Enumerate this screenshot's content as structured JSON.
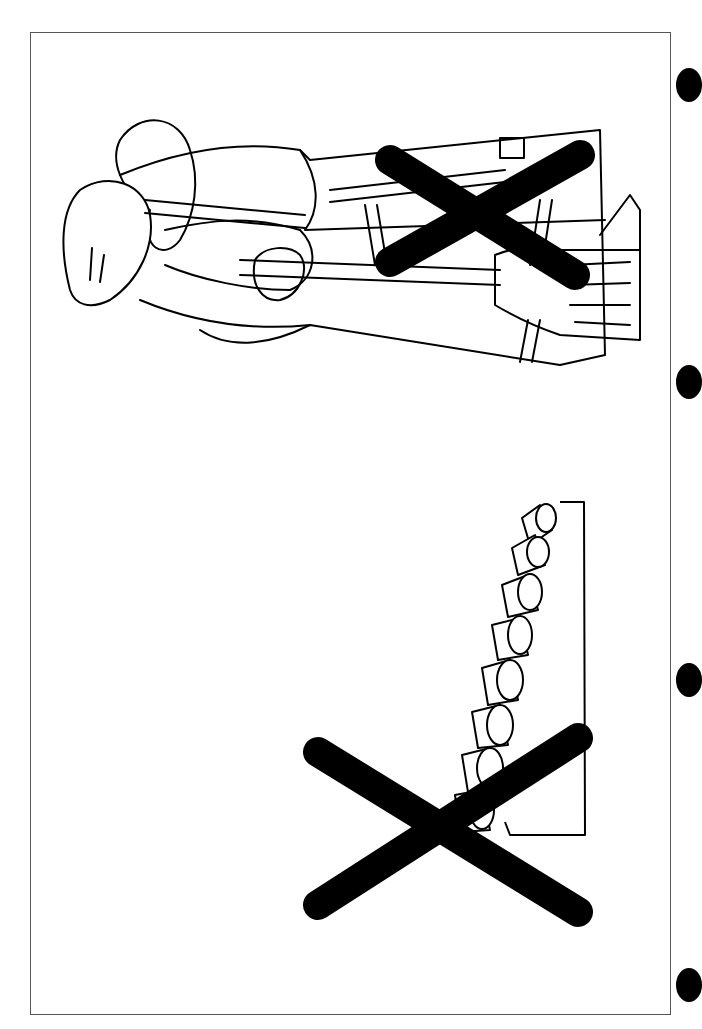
{
  "page": {
    "background": "#ffffff",
    "frame_color": "#555555",
    "ink_color": "#000000"
  },
  "illustrations": [
    {
      "id": "woman-with-broom",
      "subject": "woman sweeping with broom (rotated)",
      "crossed_out": true
    },
    {
      "id": "stack-of-logs",
      "subject": "stacked cylindrical logs/rolls on ledge (rotated)",
      "crossed_out": true
    }
  ],
  "binder_holes": [
    {
      "x": 688,
      "y": 85
    },
    {
      "x": 688,
      "y": 382
    },
    {
      "x": 688,
      "y": 680
    },
    {
      "x": 688,
      "y": 985
    }
  ]
}
